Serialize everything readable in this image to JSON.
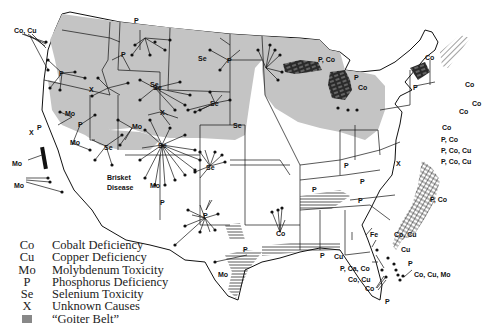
{
  "legend": {
    "items": [
      {
        "code": "Co",
        "label": "Cobalt Deficiency"
      },
      {
        "code": "Cu",
        "label": "Copper Deficiency"
      },
      {
        "code": "Mo",
        "label": "Molybdenum Toxicity"
      },
      {
        "code": "P",
        "label": "Phosphorus Deficiency"
      },
      {
        "code": "Se",
        "label": "Selenium Toxicity"
      },
      {
        "code": "X",
        "label": "Unknown Causes"
      },
      {
        "code": "",
        "label": "“Goiter Belt”",
        "swatch": "goiter-belt-hatch"
      }
    ]
  },
  "map_labels": {
    "wa_coast": "Co, Cu",
    "mt_p": "P",
    "wa_p": "P",
    "or_p": "P",
    "id_x": "X",
    "mt_se": "Se",
    "nd_se": "Se",
    "nd_p": "P",
    "nv_mo": "Mo",
    "nv_p": "P",
    "nv_mo2": "Mo",
    "ca_x": "X",
    "ca_p": "P",
    "ca_mo1": "Mo",
    "ca_mo2": "Mo",
    "wy_se": "Se",
    "wy_x": "X",
    "ut_mo": "Mo",
    "ut_se": "Se",
    "co_se": "Se",
    "az_mo": "Mo",
    "nm_p": "P",
    "brisket_1": "Brisket",
    "brisket_2": "Disease",
    "sd_se": "Se",
    "ne_se": "Se",
    "ks_se": "Se",
    "tx_p": "P",
    "tx_p2": "P",
    "tx_mo": "Mo",
    "la_co": "Co",
    "ms_p": "P",
    "al_cu": "Cu",
    "mi_pco": "P, Co",
    "mi_p": "P",
    "mi_co": "Co",
    "ny_p": "P",
    "ny_co": "Co",
    "nh_co": "Co",
    "ma_co": "Co",
    "ri_co": "Co",
    "nj_co": "Co",
    "md_pco": "P, Co",
    "va_pcocu1": "P, Co, Cu",
    "va_pcocu2": "P, Co, Cu",
    "va_x": "X",
    "nc_pco": "P, Co",
    "tn_p1": "P",
    "tn_p2": "P",
    "ky_p": "P",
    "ga_fe": "Fe",
    "fl_cocu": "Co, Cu",
    "fl_cu": "Cu",
    "fl_p": "P",
    "fl_pcaco": "P, Ca, Co",
    "fl_cocu2": "Co, Cu",
    "fl_co": "Co",
    "fl_cocumo": "Co, Cu, Mo",
    "fl_p2": "P",
    "oh_p": "P"
  }
}
